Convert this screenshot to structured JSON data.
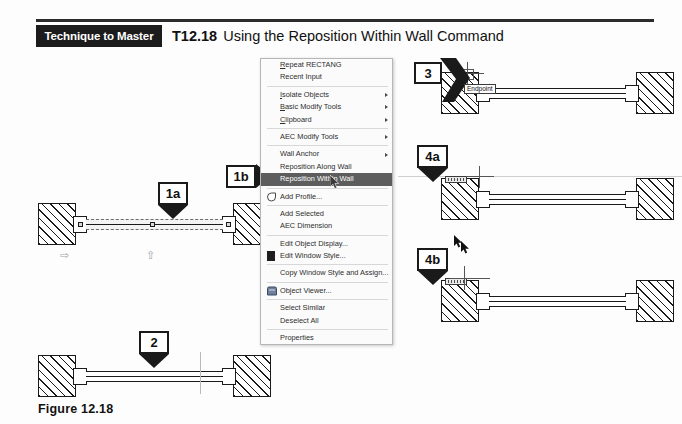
{
  "header": {
    "badge_label": "Technique to Master",
    "technique_code": "T12.18",
    "technique_title": "Using the Reposition Within Wall Command"
  },
  "figure": {
    "caption": "Figure 12.18"
  },
  "context_menu": {
    "groups": [
      {
        "items": [
          {
            "label": "Repeat RECTANG",
            "accel": "R",
            "submenu": false,
            "icon": "",
            "selected": false
          },
          {
            "label": "Recent Input",
            "accel": "",
            "submenu": false,
            "icon": "",
            "selected": false
          }
        ]
      },
      {
        "items": [
          {
            "label": "Isolate Objects",
            "accel": "I",
            "submenu": true,
            "icon": "",
            "selected": false
          },
          {
            "label": "Basic Modify Tools",
            "accel": "B",
            "submenu": true,
            "icon": "",
            "selected": false
          },
          {
            "label": "Clipboard",
            "accel": "C",
            "submenu": true,
            "icon": "",
            "selected": false
          }
        ]
      },
      {
        "items": [
          {
            "label": "AEC Modify Tools",
            "accel": "",
            "submenu": true,
            "icon": "",
            "selected": false
          }
        ]
      },
      {
        "items": [
          {
            "label": "Wall Anchor",
            "accel": "",
            "submenu": true,
            "icon": "",
            "selected": false
          },
          {
            "label": "Reposition Along Wall",
            "accel": "",
            "submenu": false,
            "icon": "",
            "selected": false
          },
          {
            "label": "Reposition Within Wall",
            "accel": "",
            "submenu": false,
            "icon": "",
            "selected": true
          }
        ]
      },
      {
        "items": [
          {
            "label": "Add Profile...",
            "accel": "",
            "submenu": false,
            "icon": "add-profile-icon",
            "selected": false
          }
        ]
      },
      {
        "items": [
          {
            "label": "Add Selected",
            "accel": "",
            "submenu": false,
            "icon": "",
            "selected": false
          },
          {
            "label": "AEC Dimension",
            "accel": "",
            "submenu": false,
            "icon": "",
            "selected": false
          }
        ]
      },
      {
        "items": [
          {
            "label": "Edit Object Display...",
            "accel": "",
            "submenu": false,
            "icon": "",
            "selected": false
          },
          {
            "label": "Edit Window Style...",
            "accel": "",
            "submenu": false,
            "icon": "edit-window-style-icon",
            "selected": false
          }
        ]
      },
      {
        "items": [
          {
            "label": "Copy Window Style and Assign...",
            "accel": "",
            "submenu": false,
            "icon": "",
            "selected": false
          }
        ]
      },
      {
        "items": [
          {
            "label": "Object Viewer...",
            "accel": "",
            "submenu": false,
            "icon": "object-viewer-icon",
            "selected": false
          }
        ]
      },
      {
        "items": [
          {
            "label": "Select Similar",
            "accel": "",
            "submenu": false,
            "icon": "",
            "selected": false
          },
          {
            "label": "Deselect All",
            "accel": "",
            "submenu": false,
            "icon": "",
            "selected": false
          }
        ]
      },
      {
        "items": [
          {
            "label": "Properties",
            "accel": "",
            "submenu": false,
            "icon": "",
            "selected": false
          }
        ]
      }
    ]
  },
  "callouts": {
    "step1a": "1a",
    "step1b": "1b",
    "step2": "2",
    "step3": "3",
    "step4a": "4a",
    "step4b": "4b"
  },
  "drawing": {
    "osnap_tooltip": "Endpoint"
  },
  "colors": {
    "badge_background": "#1c1c1c",
    "badge_text": "#ffffff",
    "rule": "#2b2b2b",
    "menu_background": "#fbfbfb",
    "menu_border": "#b6b6b6",
    "menu_highlight": "#5d5d5d",
    "menu_highlight_text": "#ffffff",
    "ink": "#1a1a1a",
    "grip": "#9aa6ac"
  }
}
